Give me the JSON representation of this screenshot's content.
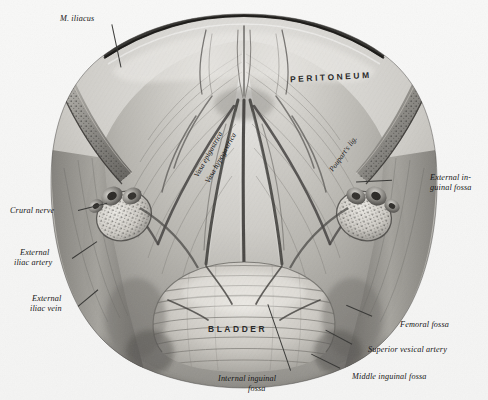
{
  "plate": {
    "title": "Interior view of the anterior abdominal wall and pelvis",
    "background_color": "#f7f7f6",
    "ink_color": "#151515",
    "style": "halftone engraving",
    "width": 488,
    "height": 400
  },
  "labels": [
    {
      "id": "m-iliacus",
      "text": "M. iliacus",
      "style": "italic"
    },
    {
      "id": "peritoneum",
      "text": "PERITONEUM",
      "style": "spaced-caps"
    },
    {
      "id": "poupart",
      "text": "Poupart's lig.",
      "style": "italic-rotated"
    },
    {
      "id": "vasa-epigastrica",
      "text": "Vasa epigastrica",
      "style": "italic-rotated"
    },
    {
      "id": "vasa-hypogastrica",
      "text": "Vasa hypogastrica",
      "style": "italic-rotated"
    },
    {
      "id": "external-inguinal-1",
      "text": "External in-",
      "style": "italic"
    },
    {
      "id": "external-inguinal-2",
      "text": "guinal fossa",
      "style": "italic"
    },
    {
      "id": "crural-nerve",
      "text": "Crural nerve",
      "style": "italic"
    },
    {
      "id": "external-iliac-artery-1",
      "text": "External",
      "style": "italic"
    },
    {
      "id": "external-iliac-artery-2",
      "text": "iliac artery",
      "style": "italic"
    },
    {
      "id": "external-iliac-vein-1",
      "text": "External",
      "style": "italic"
    },
    {
      "id": "external-iliac-vein-2",
      "text": "iliac vein",
      "style": "italic"
    },
    {
      "id": "bladder",
      "text": "BLADDER",
      "style": "spaced-caps"
    },
    {
      "id": "femoral-fossa",
      "text": "Femoral fossa",
      "style": "italic"
    },
    {
      "id": "superior-vesical",
      "text": "Superior vesical artery",
      "style": "italic"
    },
    {
      "id": "middle-inguinal",
      "text": "Middle inguinal fossa",
      "style": "italic"
    },
    {
      "id": "internal-inguinal-1",
      "text": "Internal inguinal",
      "style": "italic"
    },
    {
      "id": "internal-inguinal-2",
      "text": "fossa",
      "style": "italic"
    }
  ]
}
